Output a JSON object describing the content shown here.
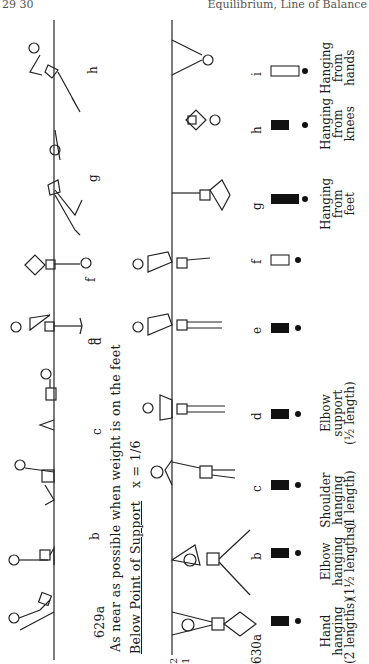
{
  "header": {
    "page_number": "29 30",
    "running_title": "Equilibrium, Line of Balance"
  },
  "upper_section": {
    "figure_number": "629a",
    "caption": "As near as possible when weight is on the feet",
    "figure_labels": [
      "b",
      "c",
      "d",
      "e",
      "f",
      "g",
      "h"
    ]
  },
  "lower_section": {
    "heading": "Below Point of Support",
    "formula": "x = 1/6",
    "figure_number": "630a",
    "scale_marks": [
      "2",
      "1"
    ],
    "figure_labels": [
      "b",
      "c",
      "d",
      "e",
      "f",
      "g",
      "h",
      "i"
    ],
    "descriptions": [
      {
        "id": "a",
        "text": [
          "Hand",
          "hanging",
          "(2 lengths)"
        ]
      },
      {
        "id": "b",
        "text": [
          "Elbow",
          "hanging",
          "(1½ lengths)"
        ]
      },
      {
        "id": "c",
        "text": [
          "Shoulder",
          "hanging",
          "(1 length)"
        ]
      },
      {
        "id": "d",
        "text": [
          "Elbow",
          "support",
          "(½ length)"
        ]
      },
      {
        "id": "g",
        "text": [
          "Hanging",
          "from",
          "feet"
        ]
      },
      {
        "id": "h",
        "text": [
          "Hanging",
          "from",
          "knees"
        ]
      },
      {
        "id": "i",
        "text": [
          "Hanging",
          "from",
          "hands"
        ]
      }
    ]
  }
}
